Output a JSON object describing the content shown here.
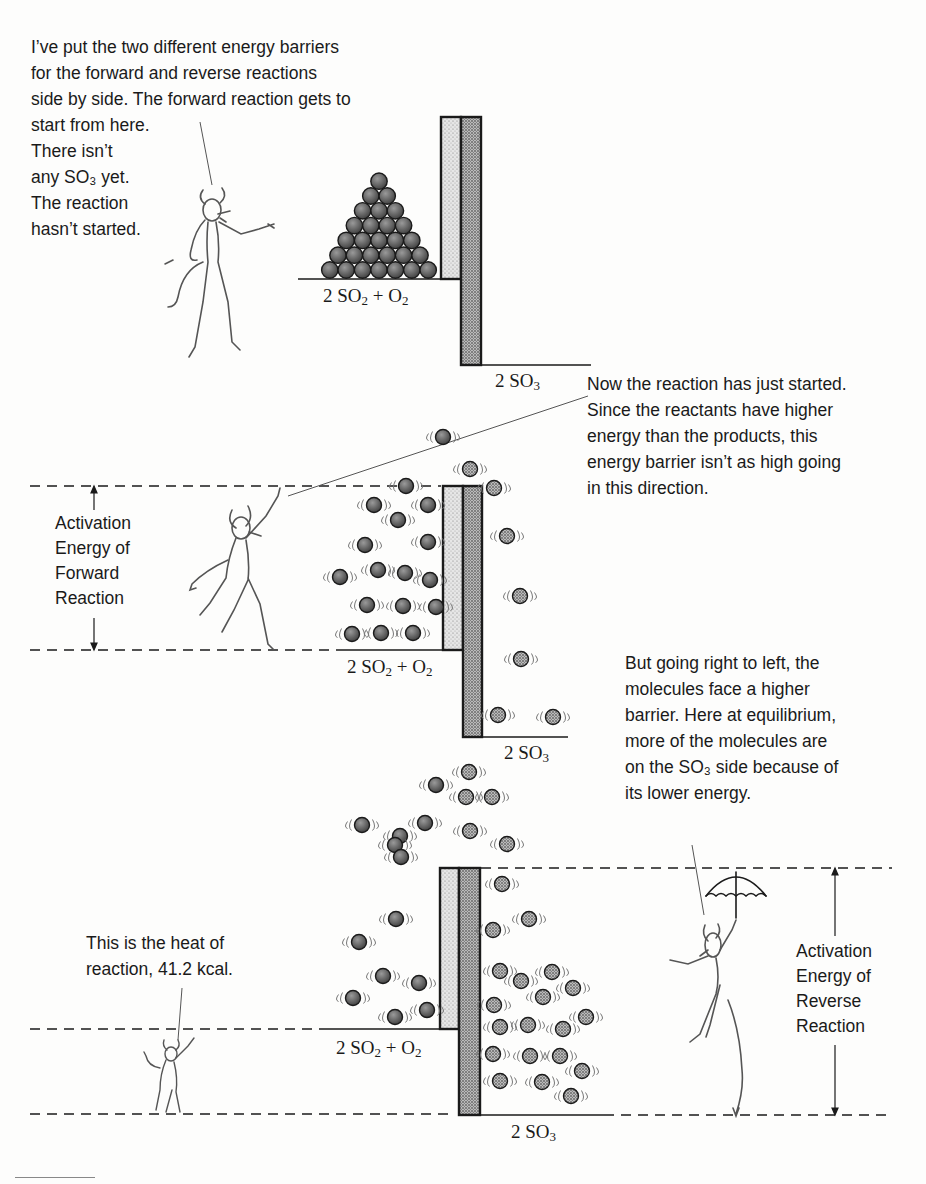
{
  "panel1": {
    "caption_lines": [
      "I’ve put the two different energy barriers",
      "for the forward and reverse reactions",
      "side by side. The forward reaction gets to",
      "start from here.",
      "There isn’t",
      "any SO₃ yet.",
      "The reaction",
      "hasn’t started."
    ],
    "left_label": {
      "pre": "2 SO",
      "sub1": "2",
      "mid": " + O",
      "sub2": "2"
    },
    "right_label": {
      "pre": "2 SO",
      "sub1": "3"
    },
    "pyramid_rows": 7
  },
  "panel2": {
    "caption_lines": [
      "Now the reaction has just started.",
      "Since the reactants have higher",
      "energy than the products, this",
      "energy barrier isn’t as high going",
      "in this direction."
    ],
    "activation_label_lines": [
      "Activation",
      "Energy of",
      "Forward",
      "Reaction"
    ],
    "left_label": {
      "pre": "2 SO",
      "sub1": "2",
      "mid": " + O",
      "sub2": "2"
    },
    "right_label": {
      "pre": "2 SO",
      "sub1": "3"
    }
  },
  "panel3": {
    "caption_lines": [
      "But going right to left, the",
      "molecules face a higher",
      "barrier. Here at equilibrium,",
      "more of the molecules are",
      "on the SO₃ side because of",
      "its lower energy."
    ],
    "heat_caption_lines": [
      "This is the heat of",
      "reaction, 41.2 kcal."
    ],
    "activation_label_lines": [
      "Activation",
      "Energy of",
      "Reverse",
      "Reaction"
    ],
    "left_label": {
      "pre": "2 SO",
      "sub1": "2",
      "mid": " + O",
      "sub2": "2"
    },
    "right_label": {
      "pre": "2 SO",
      "sub1": "3"
    }
  },
  "colors": {
    "ink": "#1a1a1a",
    "reactant_ball": "#5a5a5a",
    "product_ball": "#9a9a9a",
    "barrier_light": "#d8d8d8",
    "barrier_dark": "#8c8c8c"
  },
  "molecules": {
    "panel2_reactants": [
      [
        443,
        437
      ],
      [
        406,
        486
      ],
      [
        374,
        505
      ],
      [
        428,
        505
      ],
      [
        398,
        520
      ],
      [
        428,
        542
      ],
      [
        365,
        545
      ],
      [
        378,
        570
      ],
      [
        405,
        573
      ],
      [
        430,
        580
      ],
      [
        340,
        577
      ],
      [
        367,
        605
      ],
      [
        403,
        606
      ],
      [
        436,
        607
      ],
      [
        352,
        634
      ],
      [
        381,
        633
      ],
      [
        413,
        633
      ]
    ],
    "panel2_products": [
      [
        470,
        469
      ],
      [
        494,
        488
      ],
      [
        507,
        536
      ],
      [
        520,
        596
      ],
      [
        521,
        659
      ],
      [
        498,
        715
      ],
      [
        553,
        717
      ]
    ],
    "panel3_reactants": [
      [
        436,
        785
      ],
      [
        425,
        823
      ],
      [
        400,
        836
      ],
      [
        395,
        845
      ],
      [
        401,
        857
      ],
      [
        362,
        825
      ],
      [
        396,
        919
      ],
      [
        359,
        942
      ],
      [
        383,
        976
      ],
      [
        419,
        983
      ],
      [
        353,
        998
      ],
      [
        395,
        1017
      ],
      [
        427,
        1010
      ]
    ],
    "panel3_products": [
      [
        469,
        772
      ],
      [
        466,
        797
      ],
      [
        492,
        797
      ],
      [
        470,
        831
      ],
      [
        507,
        844
      ],
      [
        502,
        884
      ],
      [
        529,
        919
      ],
      [
        493,
        930
      ],
      [
        500,
        971
      ],
      [
        521,
        981
      ],
      [
        552,
        972
      ],
      [
        543,
        997
      ],
      [
        573,
        988
      ],
      [
        586,
        1017
      ],
      [
        494,
        1005
      ],
      [
        500,
        1027
      ],
      [
        528,
        1025
      ],
      [
        563,
        1029
      ],
      [
        493,
        1054
      ],
      [
        530,
        1056
      ],
      [
        560,
        1056
      ],
      [
        582,
        1071
      ],
      [
        500,
        1081
      ],
      [
        542,
        1082
      ],
      [
        571,
        1096
      ]
    ]
  }
}
